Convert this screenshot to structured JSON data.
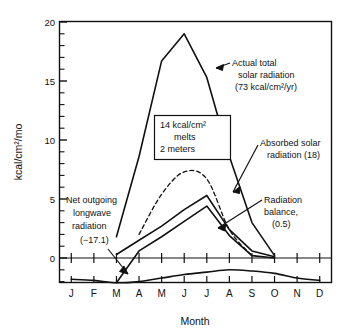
{
  "figure": {
    "name": "arctic-radiation-budget-chart",
    "background": "#ffffff",
    "ink": "#111111"
  },
  "axes": {
    "y_label": "kcal/cm²/mo",
    "x_label": "Month",
    "y_ticks": [
      "0",
      "5",
      "10",
      "15",
      "20"
    ],
    "y_tick_values": [
      0,
      5,
      10,
      15,
      20
    ],
    "y_minor_step": 1,
    "ylim": [
      -2.3,
      20
    ],
    "x_ticks": [
      "J",
      "F",
      "M",
      "A",
      "M",
      "J",
      "J",
      "A",
      "S",
      "O",
      "N",
      "D"
    ],
    "grid": "off",
    "frame": "box"
  },
  "annotations": {
    "actual_total": {
      "line1": "Actual total",
      "line2": "solar radiation",
      "line3": "(73 kcal/cm²/yr)"
    },
    "melt_box": {
      "line1": "14 kcal/cm²",
      "line2": "melts",
      "line3": "2 meters"
    },
    "absorbed": {
      "line1": "Absorbed solar",
      "line2": "radiation (18)"
    },
    "balance": {
      "line1": "Radiation",
      "line2": "balance,",
      "line3": "(0.5)"
    },
    "longwave": {
      "line1": "Net outgoing",
      "line2": "longwave",
      "line3": "radiation",
      "line4": "(−17.1)"
    }
  },
  "chart_data": {
    "type": "line",
    "title": "",
    "xlabel": "Month",
    "ylabel": "kcal/cm²/mo",
    "ylim": [
      -2.3,
      20
    ],
    "categories": [
      "J",
      "F",
      "M",
      "A",
      "M",
      "J",
      "J",
      "A",
      "S",
      "O",
      "N",
      "D"
    ],
    "legend": "inline-annotations",
    "series": [
      {
        "name": "Actual total solar radiation",
        "annual_total": "73 kcal/cm²/yr",
        "style": "solid",
        "x": [
          "M",
          "A",
          "M",
          "J",
          "J",
          "A",
          "S",
          "O"
        ],
        "values": [
          1.8,
          8.6,
          16.7,
          19.0,
          15.3,
          8.6,
          3.0,
          0.2
        ]
      },
      {
        "name": "Absorbed solar radiation",
        "annual_total": "18",
        "style": "solid",
        "x": [
          "M",
          "A",
          "M",
          "J",
          "J",
          "A",
          "S",
          "O"
        ],
        "values": [
          0.3,
          1.5,
          2.7,
          4.1,
          5.3,
          2.4,
          0.6,
          0.1
        ]
      },
      {
        "name": "Radiation balance",
        "annual_total": "0.5",
        "style": "solid",
        "x": [
          "M",
          "A",
          "M",
          "J",
          "J",
          "A",
          "S",
          "O"
        ],
        "values": [
          -2.1,
          0.6,
          1.8,
          3.1,
          4.4,
          1.9,
          0.2,
          0.0
        ]
      },
      {
        "name": "Dashed reference curve",
        "style": "dashed",
        "x": [
          "A",
          "M",
          "J",
          "J",
          "A",
          "S"
        ],
        "values": [
          2.0,
          5.4,
          7.3,
          6.7,
          2.4,
          0.2
        ]
      },
      {
        "name": "Net outgoing longwave radiation",
        "annual_total": "−17.1",
        "style": "solid",
        "x": [
          "J",
          "F",
          "M",
          "A",
          "M",
          "J",
          "J",
          "A",
          "S",
          "O",
          "N",
          "D"
        ],
        "values": [
          -1.8,
          -1.9,
          -2.1,
          -2.0,
          -1.7,
          -1.4,
          -1.2,
          -1.0,
          -1.1,
          -1.3,
          -1.7,
          -1.9
        ]
      }
    ]
  }
}
